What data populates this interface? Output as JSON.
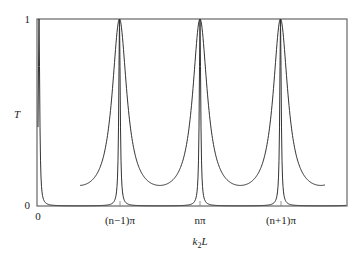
{
  "chart_data": {
    "type": "line",
    "title": "",
    "xlabel": "k2L",
    "ylabel": "T",
    "ylim": [
      0,
      1
    ],
    "grid": false,
    "legend": null,
    "y_ticks": [
      "0",
      "1"
    ],
    "x_ticks": [
      "0",
      "(n−1)π",
      "nπ",
      "(n+1)π"
    ],
    "x_tick_positions_pi_units": [
      null,
      -1,
      0,
      1
    ],
    "series": [
      {
        "name": "narrow resonance (high finesse)",
        "description": "Sharp Lorentzian-like transmission peaks reaching T=1 at k2L = (n-1)π, nπ, (n+1)π, near zero between peaks",
        "peak_positions": [
          "(n−1)π",
          "nπ",
          "(n+1)π"
        ],
        "peak_value": 1,
        "min_value": 0.0
      },
      {
        "name": "broad resonance (low finesse)",
        "description": "Broader transmission peaks reaching T=1 at the same positions with minima around T≈0.11 between peaks",
        "peak_positions": [
          "(n−1)π",
          "nπ",
          "(n+1)π"
        ],
        "peak_value": 1,
        "min_value": 0.11
      }
    ]
  },
  "axes": {
    "y_label": "T",
    "x_label_main": "k",
    "x_label_sub": "2",
    "x_label_tail": "L",
    "y_tick_top": "1",
    "y_tick_bottom": "0",
    "x_tick_origin": "0",
    "x_tick_1": "(n−1)π",
    "x_tick_2": "nπ",
    "x_tick_3": "(n+1)π"
  },
  "colors": {
    "line": "#333333",
    "axis": "#555555"
  }
}
